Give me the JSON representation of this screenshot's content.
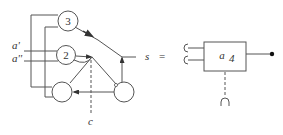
{
  "diagram": {
    "left_network": {
      "nodes": [
        {
          "id": "node-3",
          "label": "3"
        },
        {
          "id": "node-2",
          "label": "2"
        },
        {
          "id": "node-bottom-left",
          "label": ""
        },
        {
          "id": "node-bottom-right",
          "label": ""
        }
      ],
      "inputs": [
        {
          "label": "a'"
        },
        {
          "label": "a''"
        }
      ],
      "control_label": "c"
    },
    "equation": {
      "lhs": "s",
      "operator": "="
    },
    "right_block": {
      "label_base": "a",
      "label_sub": "4",
      "input_ports": 2,
      "output_port": "dot"
    },
    "colors": {
      "line": "#555555",
      "text": "#333333",
      "background": "#ffffff"
    }
  }
}
